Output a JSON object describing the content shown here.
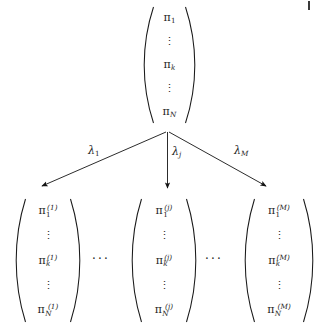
{
  "figure": {
    "ink_color": "#1a1a1a",
    "background": "#ffffff"
  },
  "parent_vector": {
    "name": "pi",
    "entries": [
      {
        "text": "π",
        "sub": "1",
        "sup": ""
      },
      {
        "text": "⋮",
        "sub": "",
        "sup": ""
      },
      {
        "text": "π",
        "sub": "k",
        "sup": ""
      },
      {
        "text": "⋮",
        "sub": "",
        "sup": ""
      },
      {
        "text": "π",
        "sub": "N",
        "sup": ""
      }
    ]
  },
  "branches": [
    {
      "id": "left",
      "label_base": "λ",
      "label_sub": "1"
    },
    {
      "id": "middle",
      "label_base": "λ",
      "label_sub": "j"
    },
    {
      "id": "right",
      "label_base": "λ",
      "label_sub": "M"
    }
  ],
  "child_vectors": [
    {
      "id": "child-1",
      "superscript": "(1)",
      "entries": [
        {
          "text": "π",
          "sub": "1",
          "sup": "(1)"
        },
        {
          "text": "⋮",
          "sub": "",
          "sup": ""
        },
        {
          "text": "π",
          "sub": "k",
          "sup": "(1)"
        },
        {
          "text": "⋮",
          "sub": "",
          "sup": ""
        },
        {
          "text": "π",
          "sub": "N",
          "sup": "(1)"
        }
      ]
    },
    {
      "id": "child-j",
      "superscript": "(j)",
      "entries": [
        {
          "text": "π",
          "sub": "1",
          "sup": "(j)"
        },
        {
          "text": "⋮",
          "sub": "",
          "sup": ""
        },
        {
          "text": "π",
          "sub": "k",
          "sup": "(j)"
        },
        {
          "text": "⋮",
          "sub": "",
          "sup": ""
        },
        {
          "text": "π",
          "sub": "N",
          "sup": "(j)"
        }
      ]
    },
    {
      "id": "child-M",
      "superscript": "(M)",
      "entries": [
        {
          "text": "π",
          "sub": "1",
          "sup": "(M)"
        },
        {
          "text": "⋮",
          "sub": "",
          "sup": ""
        },
        {
          "text": "π",
          "sub": "k",
          "sup": "(M)"
        },
        {
          "text": "⋮",
          "sub": "",
          "sup": ""
        },
        {
          "text": "π",
          "sub": "N",
          "sup": "(M)"
        }
      ]
    }
  ],
  "separators": [
    {
      "id": "gap-left",
      "text": "···"
    },
    {
      "id": "gap-right",
      "text": "···"
    }
  ]
}
